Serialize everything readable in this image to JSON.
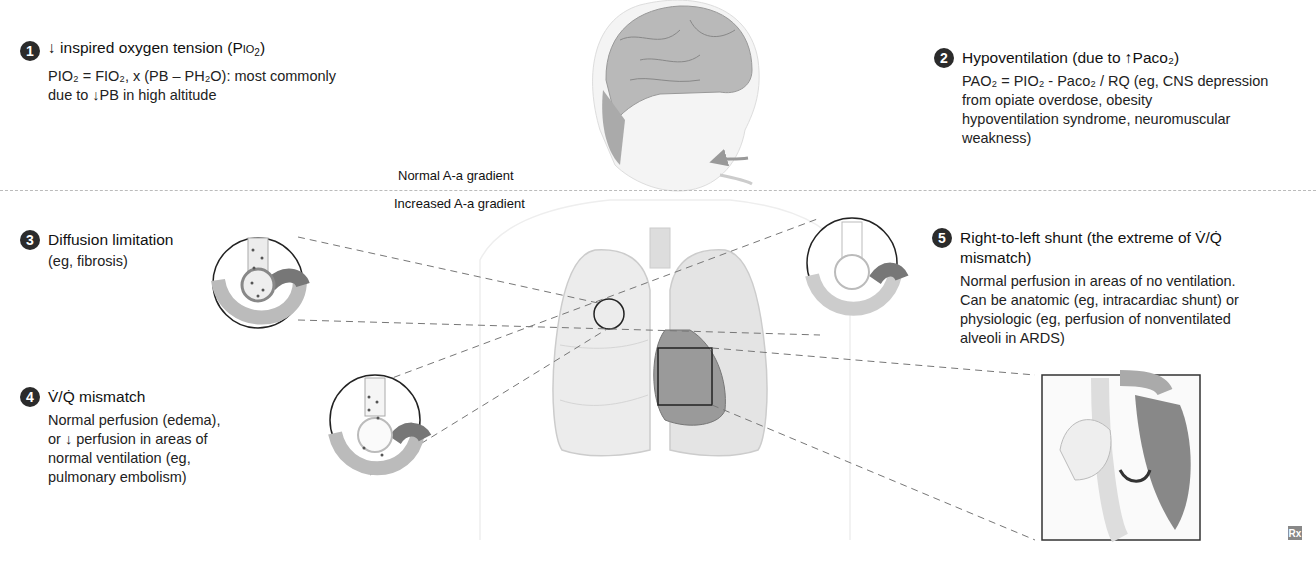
{
  "sections": [
    {
      "number": "1",
      "title_arrow": "↓",
      "title": "inspired oxygen tension (P",
      "title_sc": "IO",
      "title_sub": "2",
      "title_end": ")",
      "line1": "PIO₂ = FIO₂, x (PB – PH₂O): most commonly",
      "line2_pre": "due to ",
      "line2_arrow": "↓",
      "line2_post": "PB in high altitude"
    },
    {
      "number": "2",
      "title": "Hypoventilation (due to ",
      "title_arrow": "↑",
      "title_end": "Paco₂)",
      "lines": [
        "PAO₂ = PIO₂ - Paco₂ / RQ (eg, CNS depression",
        "from opiate overdose, obesity",
        "hypoventilation syndrome, neuromuscular",
        "weakness)"
      ]
    },
    {
      "number": "3",
      "title": "Diffusion limitation",
      "lines": [
        "(eg, fibrosis)"
      ]
    },
    {
      "number": "4",
      "title": "V̇/Q̇ mismatch",
      "lines": [
        "Normal perfusion (edema),",
        "or ↓ perfusion in areas of",
        "normal ventilation (eg,",
        "pulmonary embolism)"
      ]
    },
    {
      "number": "5",
      "title_lines": [
        "Right-to-left shunt (the extreme of V̇/Q̇",
        "mismatch)"
      ],
      "lines": [
        "Normal perfusion in areas of no ventilation.",
        "Can be anatomic (eg, intracardiac shunt) or",
        "physiologic (eg, perfusion of nonventilated",
        "alveoli in ARDS)"
      ]
    }
  ],
  "gradient_labels": {
    "normal": "Normal A-a gradient",
    "increased": "Increased A-a gradient"
  },
  "logo": "Rx",
  "colors": {
    "badge": "#2b2b2b",
    "text": "#1a1a1a",
    "divider": "#bbbbbb",
    "lung": "#e6e6e6",
    "heart": "#8a8a8a"
  }
}
